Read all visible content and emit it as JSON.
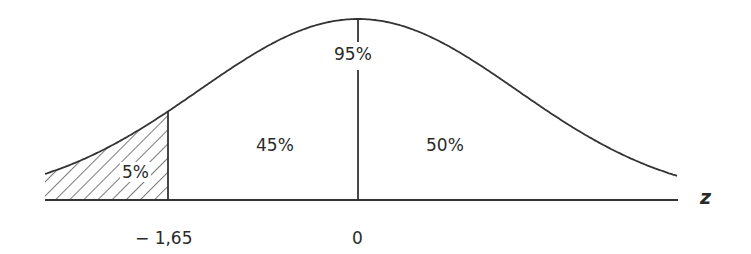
{
  "chart_data": {
    "type": "area",
    "title": "",
    "xlabel": "z",
    "ylabel": "",
    "x_ticks": [
      "− 1,65",
      "0"
    ],
    "regions": [
      {
        "name": "left-tail",
        "from": "-inf",
        "to": -1.65,
        "label": "5%",
        "shaded": true
      },
      {
        "name": "between",
        "from": -1.65,
        "to": 0,
        "label": "45%",
        "shaded": false
      },
      {
        "name": "right-half",
        "from": 0,
        "to": "inf",
        "label": "50%",
        "shaded": false
      }
    ],
    "annotations": [
      {
        "text": "95%",
        "position": "top at z=0",
        "meaning": "area to the right of -1.65"
      }
    ],
    "grid": false,
    "legend": "none"
  },
  "labels": {
    "tail": "5%",
    "middle": "45%",
    "right": "50%",
    "top": "95%",
    "tick_neg": "− 1,65",
    "tick_zero": "0",
    "axis": "z"
  },
  "colors": {
    "line": "#333333",
    "background": "#ffffff"
  }
}
